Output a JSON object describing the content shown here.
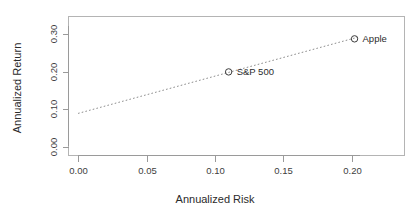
{
  "chart_data": {
    "type": "scatter",
    "title": "",
    "xlabel": "Annualized Risk",
    "ylabel": "Annualized Return",
    "xlim": [
      -0.007,
      0.2385
    ],
    "ylim": [
      -0.0225,
      0.3475
    ],
    "xticks": [
      0.0,
      0.05,
      0.1,
      0.15,
      0.2
    ],
    "xticklabels": [
      "0.00",
      "0.05",
      "0.10",
      "0.15",
      "0.20"
    ],
    "yticks": [
      0.0,
      0.1,
      0.2,
      0.3
    ],
    "yticklabels": [
      "0.00",
      "0.10",
      "0.20",
      "0.30"
    ],
    "grid": false,
    "legend": "none",
    "marker": "open-circle",
    "points": [
      {
        "label": "S&P 500",
        "x": 0.11,
        "y": 0.2
      },
      {
        "label": "Apple",
        "x": 0.202,
        "y": 0.288
      }
    ],
    "annotations": [
      {
        "type": "fit-line",
        "style": "dotted",
        "x0": 0.0,
        "y0": 0.0895,
        "x1": 0.2045,
        "y1": 0.2925
      }
    ]
  }
}
